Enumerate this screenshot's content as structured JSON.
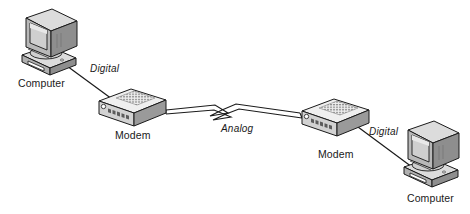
{
  "diagram": {
    "background_color": "#ffffff",
    "line_color": "#1a1a1a",
    "nodes": [
      {
        "id": "computer-left",
        "type": "computer",
        "label": "Computer",
        "label_x": 18,
        "label_y": 78
      },
      {
        "id": "modem-left",
        "type": "modem",
        "label": "Modem",
        "label_x": 115,
        "label_y": 130
      },
      {
        "id": "modem-right",
        "type": "modem",
        "label": "Modem",
        "label_x": 318,
        "label_y": 149
      },
      {
        "id": "computer-right",
        "type": "computer",
        "label": "Computer",
        "label_x": 407,
        "label_y": 193
      }
    ],
    "links": [
      {
        "id": "link-digital-left",
        "label": "Digital",
        "signal": "digital",
        "style": "single-line",
        "label_x": 90,
        "label_y": 64,
        "from": "computer-left",
        "to": "modem-left"
      },
      {
        "id": "link-analog",
        "label": "Analog",
        "signal": "analog",
        "style": "zigzag-ribbon",
        "label_x": 221,
        "label_y": 124,
        "from": "modem-left",
        "to": "modem-right"
      },
      {
        "id": "link-digital-right",
        "label": "Digital",
        "signal": "digital",
        "style": "single-line",
        "label_x": 369,
        "label_y": 127,
        "from": "modem-right",
        "to": "computer-right"
      }
    ],
    "palette": {
      "stroke": "#1a1a1a",
      "case_front": "#b8b8b8",
      "case_side": "#8e8e8e",
      "case_top": "#dcdcdc",
      "screen": "#cfcfcf",
      "screen_shade": "#a8a8a8",
      "modem_top": "#efefef",
      "modem_front": "#d2d2d2",
      "modem_side": "#9a9a9a",
      "vent": "#7a7a7a",
      "led": "#5c5c5c",
      "white": "#ffffff"
    }
  }
}
